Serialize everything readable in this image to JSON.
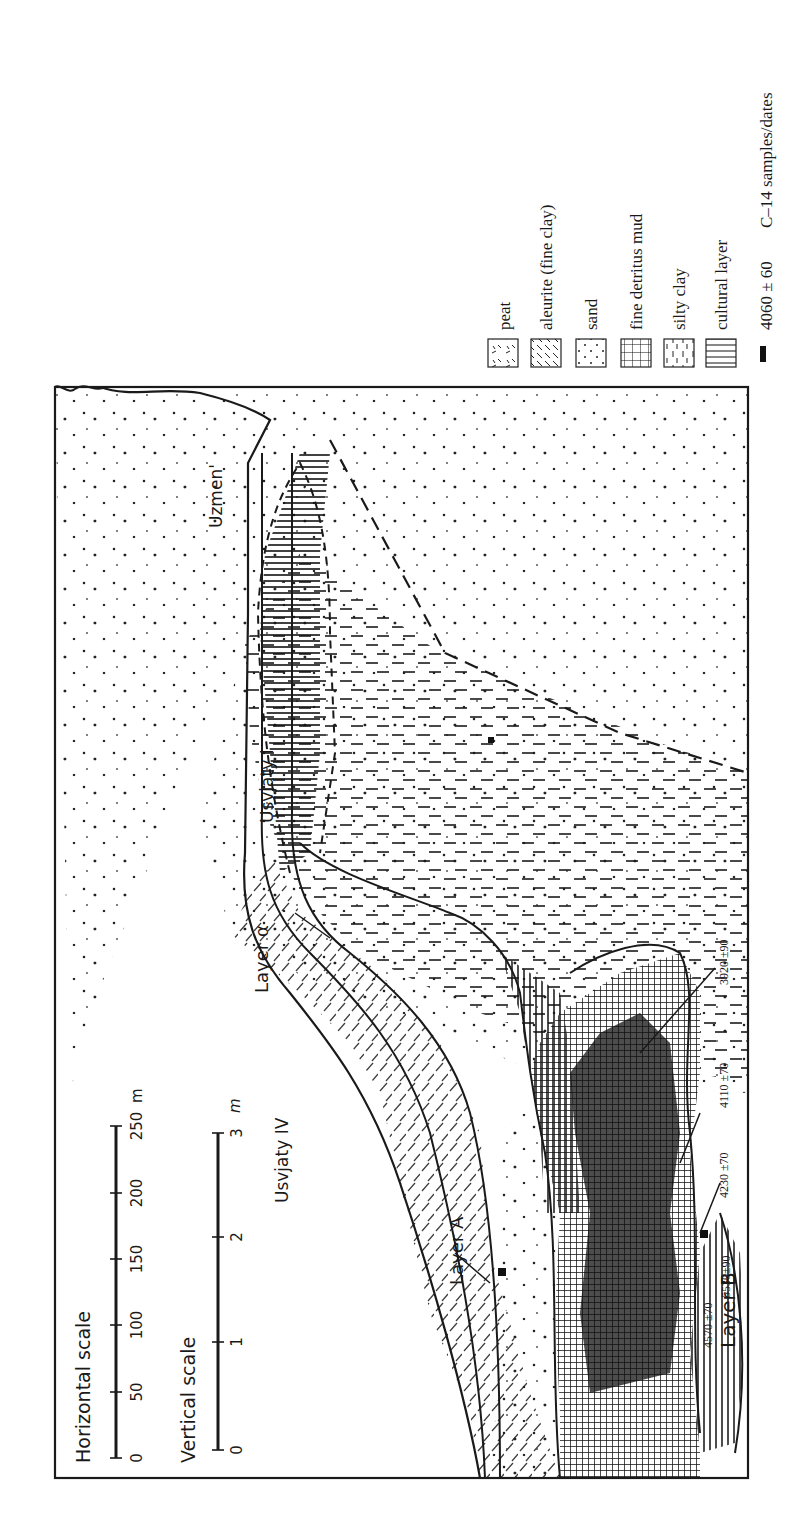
{
  "figure": {
    "orientation": "rotated 90deg counter-clockwise",
    "colors": {
      "ink": "#1a1a1a",
      "paper": "#ffffff",
      "dark_fill": "#111111"
    }
  },
  "scales": {
    "horizontal": {
      "title": "Horizontal  scale",
      "ticks": [
        "0",
        "50",
        "100",
        "150",
        "200",
        "250"
      ],
      "unit": "m"
    },
    "vertical": {
      "title": "Vertical  scale",
      "ticks": [
        "0",
        "1",
        "2",
        "3"
      ],
      "unit": "m"
    }
  },
  "sites": {
    "usvjaty_iv": "Usvjaty IV",
    "usvjaty_i": "Usvjaty I",
    "uzmen": "Uzmen'"
  },
  "layers": {
    "layer_a": "Layer A",
    "layer_b": "Layer B",
    "layer_alpha": "Layer α"
  },
  "dates": [
    {
      "value": "3920 ±90"
    },
    {
      "value": "4110 ±70"
    },
    {
      "value": "4230 ±70"
    },
    {
      "value": "5530±90"
    },
    {
      "value": "4570 ±70"
    }
  ],
  "legend": {
    "items": [
      {
        "pattern": "peat",
        "label": "peat"
      },
      {
        "pattern": "aleurite",
        "label": "aleurite (fine clay)"
      },
      {
        "pattern": "sand",
        "label": "sand"
      },
      {
        "pattern": "detritus",
        "label": "fine detritus mud"
      },
      {
        "pattern": "silty-clay",
        "label": "silty clay"
      },
      {
        "pattern": "cultural",
        "label": "cultural layer"
      }
    ],
    "c14": {
      "value": "4060 ± 60",
      "label": "C–14 samples/dates"
    }
  }
}
